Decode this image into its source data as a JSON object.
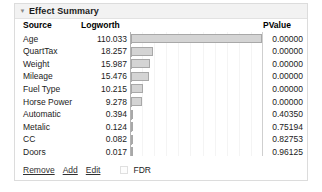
{
  "panel": {
    "title": "Effect Summary",
    "disclosure_icon": "triangle-down-icon",
    "disclosure_glyph": "▼"
  },
  "table": {
    "columns": [
      "Source",
      "Logworth",
      "PValue"
    ],
    "rows": [
      {
        "source": "Age",
        "logworth": "110.033",
        "logworth_value": 110.033,
        "pvalue": "0.00000"
      },
      {
        "source": "QuartTax",
        "logworth": "18.257",
        "logworth_value": 18.257,
        "pvalue": "0.00000"
      },
      {
        "source": "Weight",
        "logworth": "15.987",
        "logworth_value": 15.987,
        "pvalue": "0.00000"
      },
      {
        "source": "Mileage",
        "logworth": "15.476",
        "logworth_value": 15.476,
        "pvalue": "0.00000"
      },
      {
        "source": "Fuel Type",
        "logworth": "10.215",
        "logworth_value": 10.215,
        "pvalue": "0.00000"
      },
      {
        "source": "Horse Power",
        "logworth": "9.278",
        "logworth_value": 9.278,
        "pvalue": "0.00000"
      },
      {
        "source": "Automatic",
        "logworth": "0.394",
        "logworth_value": 0.394,
        "pvalue": "0.40350"
      },
      {
        "source": "Metalic",
        "logworth": "0.124",
        "logworth_value": 0.124,
        "pvalue": "0.75194"
      },
      {
        "source": "CC",
        "logworth": "0.082",
        "logworth_value": 0.082,
        "pvalue": "0.82753"
      },
      {
        "source": "Doors",
        "logworth": "0.017",
        "logworth_value": 0.017,
        "pvalue": "0.96125"
      }
    ]
  },
  "chart_data": {
    "type": "bar",
    "orientation": "horizontal",
    "title": "Effect Summary",
    "xlabel": "Logworth",
    "ylabel": "Source",
    "categories": [
      "Age",
      "QuartTax",
      "Weight",
      "Mileage",
      "Fuel Type",
      "Horse Power",
      "Automatic",
      "Metalic",
      "CC",
      "Doors"
    ],
    "values": [
      110.033,
      18.257,
      15.987,
      15.476,
      10.215,
      9.278,
      0.394,
      0.124,
      0.082,
      0.017
    ],
    "xlim": [
      0,
      110.033
    ],
    "grid": true,
    "legend": false
  },
  "footer": {
    "remove_label": "Remove",
    "add_label": "Add",
    "edit_label": "Edit",
    "fdr_label": "FDR",
    "fdr_checked": false
  },
  "colors": {
    "bar_fill": "#d4d4d4",
    "bar_border": "#a8a8a8",
    "title_bar": "#f2f2f2",
    "panel_border": "#dcdcdc",
    "text": "#1b1b1b"
  }
}
